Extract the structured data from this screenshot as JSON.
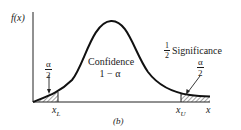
{
  "figure": {
    "panel_label": "(b)",
    "y_axis_label": "f(x)",
    "x_axis_label": "x",
    "x_lower_label": "x",
    "x_lower_sub": "L",
    "x_upper_label": "x",
    "x_upper_sub": "U",
    "center_region": {
      "line1": "Confidence",
      "line2": "1 − α"
    },
    "significance_note": {
      "half_num": "1",
      "half_den": "2",
      "text": "Significance"
    },
    "left_tail": {
      "num": "α",
      "den": "2"
    },
    "right_tail": {
      "num": "α",
      "den": "2"
    },
    "colors": {
      "curve": "#111111",
      "axis": "#222222",
      "hatch": "#333333",
      "text": "#1a1a1a"
    }
  }
}
